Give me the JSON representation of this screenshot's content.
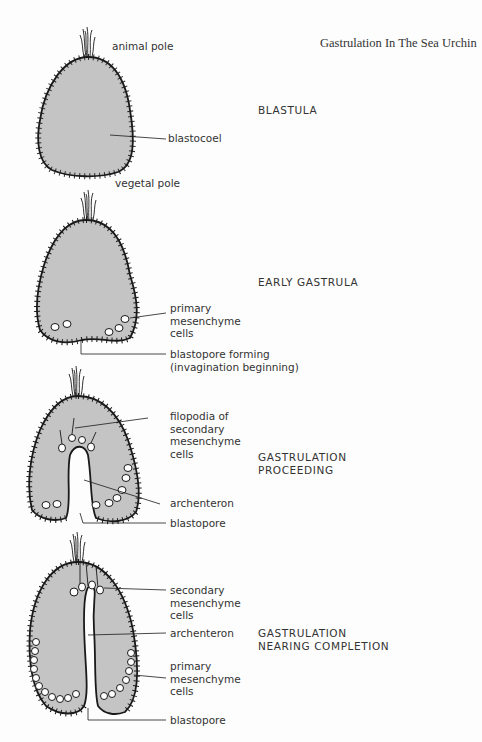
{
  "title": "Gastrulation In The Sea Urchin",
  "colors": {
    "fill": "#c4c4c4",
    "outline": "#1a1a1a",
    "background": "#fdfdfd",
    "text": "#333333"
  },
  "stages": [
    {
      "name": "BLASTULA",
      "labels": {
        "top": "animal pole",
        "cavity": "blastocoel",
        "bottom": "vegetal pole"
      }
    },
    {
      "name": "EARLY GASTRULA",
      "labels": {
        "cells": "primary\nmesenchyme\ncells",
        "blastopore": "blastopore forming\n(invagination beginning)"
      }
    },
    {
      "name": "GASTRULATION\nPROCEEDING",
      "labels": {
        "filopodia": "filopodia of\nsecondary\nmesenchyme\ncells",
        "archenteron": "archenteron",
        "blastopore": "blastopore"
      }
    },
    {
      "name": "GASTRULATION\nNEARING COMPLETION",
      "labels": {
        "secondary": "secondary\nmesenchyme\ncells",
        "archenteron": "archenteron",
        "primary": "primary\nmesenchyme\ncells",
        "blastopore": "blastopore"
      }
    }
  ]
}
